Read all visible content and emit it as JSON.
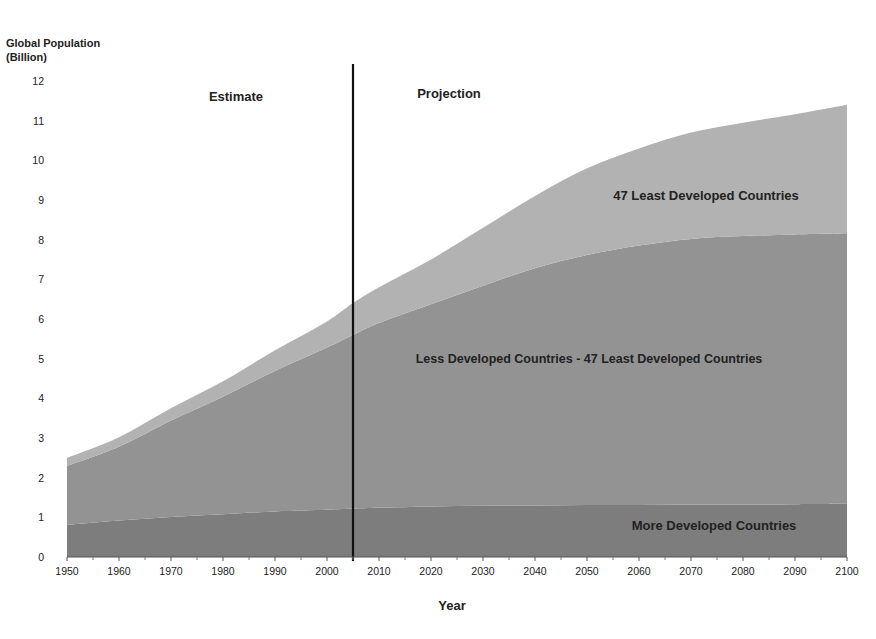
{
  "chart_data": {
    "type": "area",
    "stacked": true,
    "title": "",
    "ylabel": "Global Population (Billion)",
    "ylabel_lines": [
      "Global Population",
      "(Billion)"
    ],
    "xlabel": "Year",
    "xlim": [
      1950,
      2100
    ],
    "ylim": [
      0,
      12
    ],
    "x_ticks": [
      1950,
      1960,
      1970,
      1980,
      1990,
      2000,
      2010,
      2020,
      2030,
      2040,
      2050,
      2060,
      2070,
      2080,
      2090,
      2100
    ],
    "y_ticks": [
      0,
      1,
      2,
      3,
      4,
      5,
      6,
      7,
      8,
      9,
      10,
      11,
      12
    ],
    "grid": false,
    "legend": "inline labels",
    "divider": {
      "year": 2005,
      "left_label": "Estimate",
      "right_label": "Projection"
    },
    "x": [
      1950,
      1960,
      1970,
      1980,
      1990,
      2000,
      2005,
      2010,
      2020,
      2030,
      2040,
      2050,
      2060,
      2070,
      2080,
      2090,
      2100
    ],
    "series": [
      {
        "name": "More Developed Countries",
        "color": "#7d7d7d",
        "values": [
          0.81,
          0.92,
          1.01,
          1.08,
          1.15,
          1.19,
          1.22,
          1.24,
          1.27,
          1.29,
          1.3,
          1.31,
          1.31,
          1.32,
          1.32,
          1.33,
          1.34
        ]
      },
      {
        "name": "Less Developed Countries - 47 Least Developed Countries",
        "color": "#939393",
        "values": [
          1.49,
          1.86,
          2.43,
          2.96,
          3.54,
          4.09,
          4.38,
          4.66,
          5.1,
          5.55,
          5.98,
          6.3,
          6.54,
          6.7,
          6.77,
          6.8,
          6.82
        ]
      },
      {
        "name": "47 Least Developed Countries",
        "color": "#b2b2b2",
        "values": [
          0.2,
          0.24,
          0.31,
          0.39,
          0.52,
          0.66,
          0.8,
          0.9,
          1.13,
          1.46,
          1.82,
          2.19,
          2.45,
          2.68,
          2.86,
          3.03,
          3.24
        ]
      }
    ],
    "totals": [
      2.5,
      3.02,
      3.75,
      4.43,
      5.21,
      5.94,
      6.4,
      6.8,
      7.5,
      8.3,
      9.1,
      9.8,
      10.3,
      10.7,
      10.95,
      11.16,
      11.4
    ]
  },
  "labels": {
    "ylabel_line1": "Global Population",
    "ylabel_line2": "(Billion)",
    "xlabel": "Year",
    "estimate": "Estimate",
    "projection": "Projection",
    "series_top": "47 Least Developed Countries",
    "series_mid": "Less Developed Countries - 47 Least Developed Countries",
    "series_bottom": "More Developed Countries"
  }
}
